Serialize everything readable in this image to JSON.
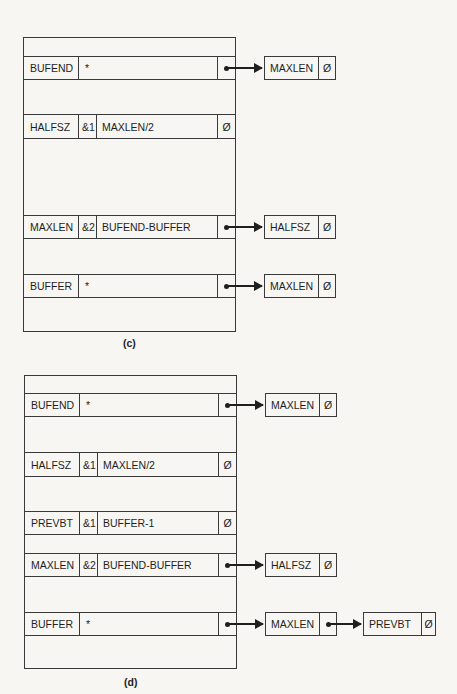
{
  "diagram_c": {
    "caption": "(c)",
    "rows": [
      {
        "name": "BUFEND",
        "idx": "",
        "value": "*",
        "tail": "pointer"
      },
      {
        "name": "HALFSZ",
        "idx": "&1",
        "value": "MAXLEN/2",
        "tail": "Ø"
      },
      {
        "name": "MAXLEN",
        "idx": "&2",
        "value": "BUFEND-BUFFER",
        "tail": "pointer"
      },
      {
        "name": "BUFFER",
        "idx": "",
        "value": "*",
        "tail": "pointer"
      }
    ],
    "links": [
      {
        "from": "BUFEND",
        "to": [
          {
            "name": "MAXLEN",
            "tail": "Ø"
          }
        ]
      },
      {
        "from": "MAXLEN",
        "to": [
          {
            "name": "HALFSZ",
            "tail": "Ø"
          }
        ]
      },
      {
        "from": "BUFFER",
        "to": [
          {
            "name": "MAXLEN",
            "tail": "Ø"
          }
        ]
      }
    ]
  },
  "diagram_d": {
    "caption": "(d)",
    "rows": [
      {
        "name": "BUFEND",
        "idx": "",
        "value": "*",
        "tail": "pointer"
      },
      {
        "name": "HALFSZ",
        "idx": "&1",
        "value": "MAXLEN/2",
        "tail": "Ø"
      },
      {
        "name": "PREVBT",
        "idx": "&1",
        "value": "BUFFER-1",
        "tail": "Ø"
      },
      {
        "name": "MAXLEN",
        "idx": "&2",
        "value": "BUFEND-BUFFER",
        "tail": "pointer"
      },
      {
        "name": "BUFFER",
        "idx": "",
        "value": "*",
        "tail": "pointer"
      }
    ],
    "links": [
      {
        "from": "BUFEND",
        "to": [
          {
            "name": "MAXLEN",
            "tail": "Ø"
          }
        ]
      },
      {
        "from": "MAXLEN",
        "to": [
          {
            "name": "HALFSZ",
            "tail": "Ø"
          }
        ]
      },
      {
        "from": "BUFFER",
        "to": [
          {
            "name": "MAXLEN",
            "tail": "pointer"
          },
          {
            "name": "PREVBT",
            "tail": "Ø"
          }
        ]
      }
    ]
  }
}
